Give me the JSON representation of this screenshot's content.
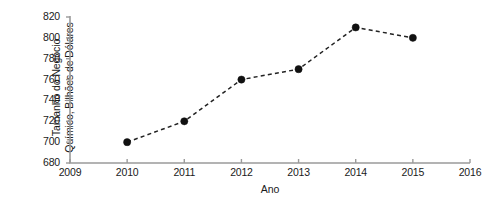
{
  "chart_data": {
    "type": "line",
    "title": "",
    "xlabel": "Ano",
    "ylabel": "Tamanho do Negócio Químico, Bilhões de Dólares",
    "ylabel_line1": "Tamanho do Negócio",
    "ylabel_line2": "Químico, Bilhões de Dólares",
    "x": [
      2010,
      2011,
      2012,
      2013,
      2014,
      2015
    ],
    "values": [
      700,
      720,
      760,
      770,
      810,
      800
    ],
    "series": [
      {
        "name": "Tamanho do Negócio Químico",
        "values": [
          700,
          720,
          760,
          770,
          810,
          800
        ]
      }
    ],
    "xlim": [
      2009,
      2016
    ],
    "ylim": [
      680,
      820
    ],
    "xticks": [
      2009,
      2010,
      2011,
      2012,
      2013,
      2014,
      2015,
      2016
    ],
    "yticks": [
      680,
      700,
      720,
      740,
      760,
      780,
      800,
      820
    ],
    "xtick_labels": [
      "2009",
      "2010",
      "2011",
      "2012",
      "2013",
      "2014",
      "2015",
      "2016"
    ],
    "ytick_labels": [
      "680",
      "700",
      "720",
      "740",
      "760",
      "780",
      "800",
      "820"
    ],
    "grid": false,
    "legend": null,
    "line_style": "dashed",
    "marker": "circle-filled",
    "colors": {
      "marker": "#111111",
      "line": "#222222",
      "axis": "#9a9a9a",
      "text": "#1a1a1a",
      "background": "#ffffff"
    }
  }
}
